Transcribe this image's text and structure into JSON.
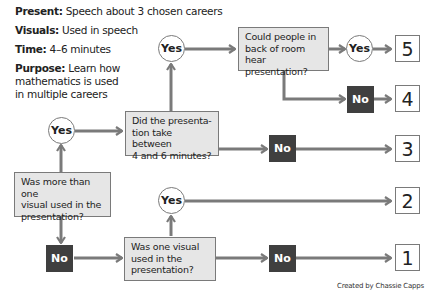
{
  "info": {
    "present": {
      "label": "Present:",
      "value": " Speech about 3 chosen careers"
    },
    "visuals": {
      "label": "Visuals:",
      "value": " Used in speech"
    },
    "time": {
      "label": "Time:",
      "value": " 4–6 minutes"
    },
    "purpose": {
      "label": "Purpose:",
      "value": " Learn how",
      "line2": "mathematics is used",
      "line3": "in multiple careers"
    }
  },
  "questions": {
    "q1": {
      "line1": "Was more than one",
      "line2": "visual used in the",
      "line3": "presentation?"
    },
    "q2": {
      "line1": "Did the presenta-",
      "line2": "tion take between",
      "line3": "4 and 6 minutes?"
    },
    "q3": {
      "line1": "Could people in",
      "line2": "back of room hear",
      "line3": "presentation?"
    },
    "q4": {
      "line1": "Was one visual",
      "line2": "used in the",
      "line3": "presentation?"
    }
  },
  "answers": {
    "yes": "Yes",
    "no": "No"
  },
  "scores": [
    "5",
    "4",
    "3",
    "2",
    "1"
  ],
  "credit": "Created by Chassie Capps",
  "colors": {
    "line": "#7a7a7a",
    "box_fill": "#e6e6e6",
    "no_fill": "#3f3f3f"
  }
}
